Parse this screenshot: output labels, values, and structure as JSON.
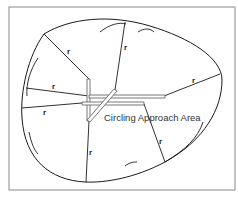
{
  "diagram": {
    "title": "Circling Approach Area",
    "radius_label": "r",
    "colors": {
      "line": "#1a1a1a",
      "frame": "#8a8a8a",
      "runway_edge": "#555555",
      "text": "#333333"
    },
    "frame": {
      "x": 9,
      "y": 7,
      "width": 226,
      "height": 183
    },
    "boundary_path": "M 44 34 C 70 18, 110 14, 150 26 C 190 38, 222 58, 222 80 C 222 108, 205 140, 165 162 C 135 178, 105 183, 85 182 C 50 180, 25 160, 22 118 C 20 92, 28 56, 44 34 Z",
    "arcs": [
      "M 100 32 C 110 24, 120 22, 126 24",
      "M 138 32 C 144 28, 150 28, 154 32",
      "M 38 58 C 30 70, 26 84, 27 96",
      "M 29 132 C 31 142, 34 150, 38 154",
      "M 125 166 C 130 162, 134 162, 137 162",
      "M 165 162 C 185 150, 198 138, 203 122"
    ],
    "radii": [
      {
        "x1": 44,
        "y1": 34,
        "x2": 89,
        "y2": 79,
        "label": "r",
        "lx": 67,
        "ly": 54
      },
      {
        "x1": 125,
        "y1": 22,
        "x2": 115,
        "y2": 90,
        "label": "r",
        "lx": 124,
        "ly": 50
      },
      {
        "x1": 220,
        "y1": 74,
        "x2": 164,
        "y2": 96,
        "label": "r",
        "lx": 192,
        "ly": 83
      },
      {
        "x1": 26,
        "y1": 88,
        "x2": 89,
        "y2": 96,
        "label": "r",
        "lx": 52,
        "ly": 89
      },
      {
        "x1": 22,
        "y1": 108,
        "x2": 82,
        "y2": 103,
        "label": "r",
        "lx": 43,
        "ly": 115
      },
      {
        "x1": 144,
        "y1": 104,
        "x2": 165,
        "y2": 162,
        "label": "r",
        "lx": 159,
        "ly": 144
      },
      {
        "x1": 89,
        "y1": 121,
        "x2": 86,
        "y2": 182,
        "label": "r",
        "lx": 89,
        "ly": 155
      }
    ],
    "runways": [
      {
        "name": "runway-vertical",
        "points": "87,79 90,79 90,121 87,121"
      },
      {
        "name": "runway-horizontal-upper",
        "points": "89,95 165,95 165,98 89,98"
      },
      {
        "name": "runway-horizontal-lower",
        "points": "82,102 144,102 144,105 82,105"
      },
      {
        "name": "runway-diagonal",
        "points": "114,89 117,91 90,122 87,120"
      }
    ],
    "title_pos": {
      "x": 104,
      "y": 121
    }
  }
}
